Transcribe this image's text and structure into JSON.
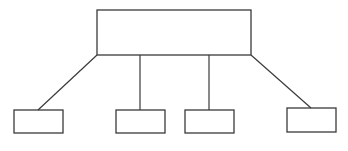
{
  "diagram": {
    "type": "tree",
    "stroke_color": "#3a3a3a",
    "background": "#ffffff",
    "root": {
      "x": 97,
      "y": 10,
      "w": 154,
      "h": 45,
      "label": ""
    },
    "children": [
      {
        "x": 14,
        "y": 110,
        "w": 49,
        "h": 23,
        "label": "",
        "connector": {
          "x1": 97,
          "y1": 55,
          "x2": 38,
          "y2": 110
        }
      },
      {
        "x": 116,
        "y": 110,
        "w": 49,
        "h": 23,
        "label": "",
        "connector": {
          "x1": 140,
          "y1": 55,
          "x2": 140,
          "y2": 110
        }
      },
      {
        "x": 185,
        "y": 110,
        "w": 49,
        "h": 23,
        "label": "",
        "connector": {
          "x1": 209,
          "y1": 55,
          "x2": 209,
          "y2": 110
        }
      },
      {
        "x": 287,
        "y": 108,
        "w": 49,
        "h": 24,
        "label": "",
        "connector": {
          "x1": 251,
          "y1": 55,
          "x2": 311,
          "y2": 108
        }
      }
    ]
  }
}
